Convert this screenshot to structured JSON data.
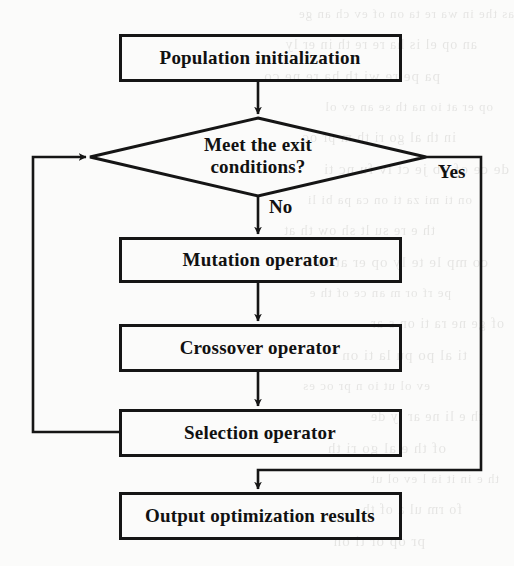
{
  "diagram": {
    "type": "flowchart",
    "stroke_color": "#151515",
    "background_color": "#fbfbfa",
    "nodes": [
      {
        "id": "start",
        "shape": "rectangle",
        "label": "Population initialization",
        "x": 120,
        "y": 35,
        "w": 280,
        "h": 45
      },
      {
        "id": "decision",
        "shape": "diamond",
        "label": "Meet the exit conditions?",
        "line1": "Meet the exit",
        "line2": "conditions?",
        "cx": 258,
        "cy": 157,
        "w": 336,
        "h": 78
      },
      {
        "id": "mutation",
        "shape": "rectangle",
        "label": "Mutation operator",
        "x": 120,
        "y": 238,
        "w": 280,
        "h": 43
      },
      {
        "id": "crossover",
        "shape": "rectangle",
        "label": "Crossover operator",
        "x": 120,
        "y": 325,
        "w": 280,
        "h": 45
      },
      {
        "id": "selection",
        "shape": "rectangle",
        "label": "Selection operator",
        "x": 120,
        "y": 410,
        "w": 280,
        "h": 45
      },
      {
        "id": "output",
        "shape": "rectangle",
        "label": "Output optimization results",
        "x": 120,
        "y": 493,
        "w": 280,
        "h": 45
      }
    ],
    "edges": [
      {
        "from": "start",
        "to": "decision",
        "label": ""
      },
      {
        "from": "decision",
        "to": "mutation",
        "label": "No"
      },
      {
        "from": "decision",
        "to": "output",
        "label": "Yes"
      },
      {
        "from": "mutation",
        "to": "crossover",
        "label": ""
      },
      {
        "from": "crossover",
        "to": "selection",
        "label": ""
      },
      {
        "from": "selection",
        "to": "decision",
        "label": ""
      }
    ],
    "edge_labels": {
      "no": "No",
      "yes": "Yes"
    }
  },
  "ghost_text": [
    "as the in wa re ta on of ev ch an ge",
    "an op el is ha re re th in er ly",
    "pa pe re wi th ha re ne co",
    "op er at io na th se an ev ol",
    "in th al go ri th m pr oc",
    "de ce of ob je ct iv fu nc ti",
    "on ti mi za ti on ca pa bi li",
    "th e re su lt sh ow th at",
    "co mp le te ly op er at io n",
    "pe rf or m an ce of th e",
    "of ge ne ra ti on s ar",
    "ti al po pu la ti on",
    "ev ol ut io n pr oc es",
    "th e li ne ar ly de",
    "of th e al go ri th",
    "th e in it ia l ev ol ut",
    "fo rm ul a of th",
    "pr op or ti on"
  ]
}
